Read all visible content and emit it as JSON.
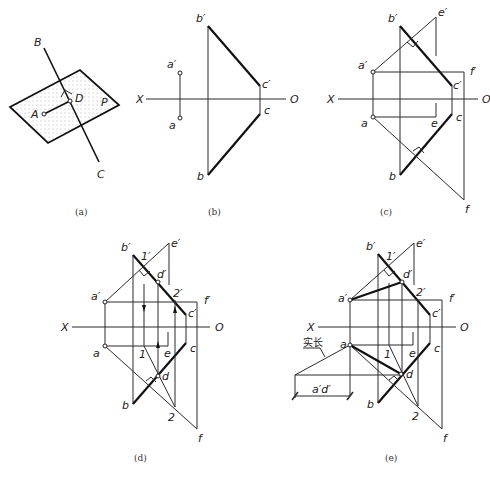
{
  "figure": {
    "panels": [
      {
        "id": "a",
        "caption": "(a)",
        "labels": {
          "B": "B",
          "C": "C",
          "A": "A",
          "D": "D",
          "P": "P"
        }
      },
      {
        "id": "b",
        "caption": "(b)",
        "labels": {
          "X": "X",
          "O": "O",
          "a_prime": "a′",
          "a": "a",
          "b_prime": "b′",
          "b": "b",
          "c_prime": "c′",
          "c": "c"
        }
      },
      {
        "id": "c",
        "caption": "(c)",
        "labels": {
          "X": "X",
          "O": "O",
          "a_prime": "a′",
          "a": "a",
          "b_prime": "b′",
          "b": "b",
          "c_prime": "c′",
          "c": "c",
          "e_prime": "e′",
          "e": "e",
          "f_prime": "f′",
          "f": "f"
        }
      },
      {
        "id": "d",
        "caption": "(d)",
        "labels": {
          "X": "X",
          "O": "O",
          "a_prime": "a′",
          "a": "a",
          "b_prime": "b′",
          "b": "b",
          "c_prime": "c′",
          "c": "c",
          "e_prime": "e′",
          "e": "e",
          "f_prime": "f′",
          "f": "f",
          "one_prime": "1′",
          "one": "1",
          "two_prime": "2′",
          "two": "2",
          "d_prime": "d′",
          "d": "d"
        }
      },
      {
        "id": "e",
        "caption": "(e)",
        "labels": {
          "X": "X",
          "O": "O",
          "a_prime": "a′",
          "a": "a",
          "b_prime": "b′",
          "b": "b",
          "c_prime": "c′",
          "c": "c",
          "e_prime": "e′",
          "e": "e",
          "f_prime": "f′",
          "f": "f",
          "one_prime": "1′",
          "one": "1",
          "two_prime": "2′",
          "two": "2",
          "d_prime": "d′",
          "d": "d",
          "true_length": "实长",
          "dim": "a′d′"
        }
      }
    ]
  }
}
